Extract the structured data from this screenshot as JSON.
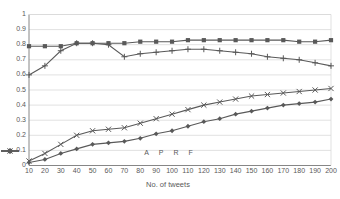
{
  "chart_data": {
    "type": "line",
    "title": "",
    "xlabel": "No. of tweets",
    "ylabel": "",
    "xlim": [
      10,
      200
    ],
    "ylim": [
      0,
      1
    ],
    "grid": true,
    "legend_position": "bottom",
    "x": [
      10,
      20,
      30,
      40,
      50,
      60,
      70,
      80,
      90,
      100,
      110,
      120,
      130,
      140,
      150,
      160,
      170,
      180,
      190,
      200
    ],
    "xtick_labels": [
      "10",
      "20",
      "30",
      "40",
      "50",
      "60",
      "70",
      "80",
      "90",
      "100",
      "110",
      "120",
      "130",
      "140",
      "150",
      "160",
      "170",
      "180",
      "190",
      "200"
    ],
    "ytick_labels": [
      "0",
      "0.1",
      "0.2",
      "0.3",
      "0.4",
      "0.5",
      "0.6",
      "0.7",
      "0.8",
      "0.9",
      "1"
    ],
    "ytick_values": [
      0,
      0.1,
      0.2,
      0.3,
      0.4,
      0.5,
      0.6,
      0.7,
      0.8,
      0.9,
      1
    ],
    "series": [
      {
        "name": "A",
        "marker": "square",
        "color": "#595959",
        "values": [
          0.79,
          0.79,
          0.79,
          0.81,
          0.81,
          0.81,
          0.81,
          0.82,
          0.82,
          0.82,
          0.83,
          0.83,
          0.83,
          0.83,
          0.83,
          0.83,
          0.83,
          0.82,
          0.82,
          0.83
        ]
      },
      {
        "name": "P",
        "marker": "plus",
        "color": "#595959",
        "values": [
          0.6,
          0.66,
          0.76,
          0.81,
          0.81,
          0.8,
          0.72,
          0.74,
          0.75,
          0.76,
          0.77,
          0.77,
          0.76,
          0.75,
          0.74,
          0.72,
          0.71,
          0.7,
          0.68,
          0.66
        ]
      },
      {
        "name": "R",
        "marker": "diamond",
        "color": "#595959",
        "values": [
          0.02,
          0.04,
          0.08,
          0.11,
          0.14,
          0.15,
          0.16,
          0.18,
          0.21,
          0.23,
          0.26,
          0.29,
          0.31,
          0.34,
          0.36,
          0.38,
          0.4,
          0.41,
          0.42,
          0.44
        ]
      },
      {
        "name": "F",
        "marker": "cross",
        "color": "#595959",
        "values": [
          0.03,
          0.08,
          0.14,
          0.2,
          0.23,
          0.24,
          0.25,
          0.28,
          0.31,
          0.34,
          0.37,
          0.4,
          0.42,
          0.44,
          0.46,
          0.47,
          0.48,
          0.49,
          0.5,
          0.51
        ]
      }
    ]
  },
  "style": {
    "axis_color": "#868686",
    "grid_color": "#d9d9d9",
    "text_color": "#595959",
    "plot_bg": "#ffffff"
  }
}
